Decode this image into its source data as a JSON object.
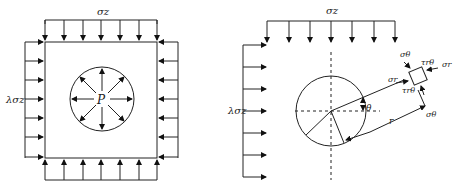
{
  "left_panel": {
    "top_load_label": "σz",
    "side_load_label": "λσz",
    "internal_pressure_label": "P"
  },
  "right_panel": {
    "top_load_label": "σz",
    "side_load_label": "λσz",
    "element_labels": {
      "sigma_theta_top": "σθ",
      "tau_top": "τrθ",
      "sigma_r_right": "σr",
      "sigma_r_left": "σr",
      "tau_bottom": "τrθ",
      "sigma_theta_bottom": "σθ"
    },
    "angle_label": "θ",
    "radius_label": "r"
  }
}
